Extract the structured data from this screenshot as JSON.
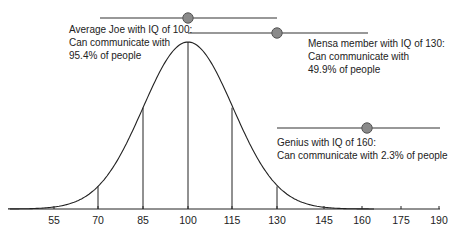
{
  "chart_data": {
    "type": "line",
    "title": "",
    "subtitle": "Normal distribution of IQ scores",
    "xlabel": "",
    "ylabel": "",
    "x_ticks": [
      55,
      70,
      85,
      100,
      115,
      130,
      145,
      160,
      175,
      190
    ],
    "xlim": [
      40,
      190
    ],
    "grid": false,
    "legend": null,
    "distribution": {
      "kind": "normal",
      "mean": 100,
      "sd": 15
    },
    "vertical_markers": [
      70,
      85,
      100,
      115,
      130
    ],
    "annotations": [
      {
        "id": "average",
        "iq": 100,
        "range": [
          70,
          130
        ],
        "lines": [
          "Average Joe with IQ of 100:",
          "Can communicate with",
          "95.4% of people"
        ],
        "percent": 95.4
      },
      {
        "id": "mensa",
        "iq": 130,
        "range": [
          100,
          160
        ],
        "lines": [
          "Mensa member with IQ of 130:",
          "Can communicate with",
          "49.9% of people"
        ],
        "percent": 49.9
      },
      {
        "id": "genius",
        "iq": 160,
        "range": [
          130,
          190
        ],
        "lines": [
          "Genius with IQ of 160:",
          "Can communicate with 2.3% of people"
        ],
        "percent": 2.3
      }
    ]
  },
  "colors": {
    "line": "#222222",
    "knob_fill": "#8a8a8a",
    "knob_stroke": "#555555"
  },
  "ticks": {
    "t0": "55",
    "t1": "70",
    "t2": "85",
    "t3": "100",
    "t4": "115",
    "t5": "130",
    "t6": "145",
    "t7": "160",
    "t8": "175",
    "t9": "190"
  },
  "labels": {
    "average": {
      "l1": "Average Joe with IQ of 100:",
      "l2": "Can communicate with",
      "l3": "95.4% of people"
    },
    "mensa": {
      "l1": "Mensa member with IQ of 130:",
      "l2": "Can communicate with",
      "l3": "49.9% of people"
    },
    "genius": {
      "l1": "Genius with IQ of 160:",
      "l2": "Can communicate with 2.3% of people"
    }
  }
}
